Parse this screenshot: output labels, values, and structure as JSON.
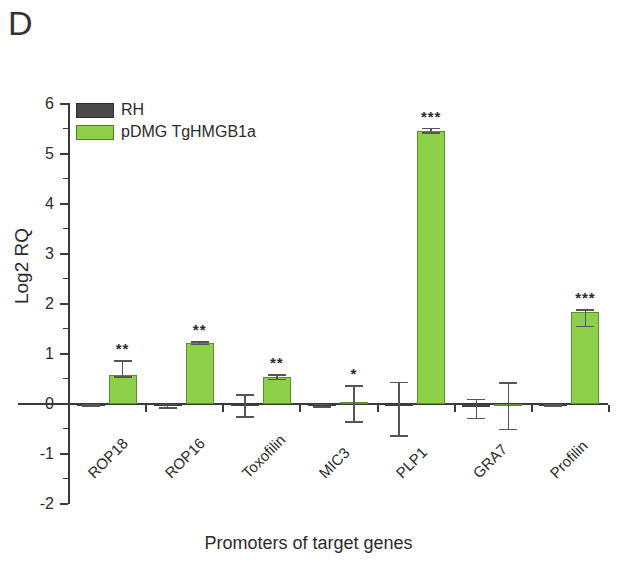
{
  "panel": {
    "letter": "D"
  },
  "chart_data": {
    "type": "bar",
    "title": "",
    "xlabel": "Promoters of target genes",
    "ylabel": "Log2 RQ",
    "ylim": [
      -2,
      6
    ],
    "yticks": [
      "6",
      "5",
      "4",
      "3",
      "2",
      "1",
      "0",
      "-1",
      "-2"
    ],
    "grid": false,
    "legend_position": "top-left",
    "categories": [
      "ROP18",
      "ROP16",
      "Toxofilin",
      "MIC3",
      "PLP1",
      "GRA7",
      "Profilin"
    ],
    "series": [
      {
        "name": "RH",
        "color": "#4a4a4a",
        "values": [
          -0.03,
          -0.04,
          -0.02,
          -0.03,
          0.0,
          -0.05,
          -0.02
        ],
        "err_upper": [
          0.03,
          0.05,
          0.22,
          0.04,
          0.45,
          0.16,
          0.03
        ],
        "err_lower": [
          0.03,
          0.05,
          0.25,
          0.04,
          0.65,
          0.25,
          0.03
        ],
        "significance": [
          "",
          "",
          "",
          "",
          "",
          "",
          ""
        ]
      },
      {
        "name": "pDMG TgHMGB1a",
        "color": "#8dd04a",
        "values": [
          0.58,
          1.22,
          0.54,
          0.05,
          5.46,
          -0.02,
          1.84
        ],
        "err_upper": [
          0.3,
          0.04,
          0.06,
          0.33,
          0.07,
          0.46,
          0.06
        ],
        "err_lower": [
          0.05,
          0.04,
          0.06,
          0.42,
          0.05,
          0.5,
          0.3
        ],
        "significance": [
          "**",
          "**",
          "**",
          "*",
          "***",
          "",
          "***"
        ]
      }
    ],
    "legend": [
      {
        "label": "RH",
        "color": "#4a4a4a",
        "swatch": "rh"
      },
      {
        "label": "pDMG TgHMGB1a",
        "color": "#8dd04a",
        "swatch": "dmg"
      }
    ]
  }
}
